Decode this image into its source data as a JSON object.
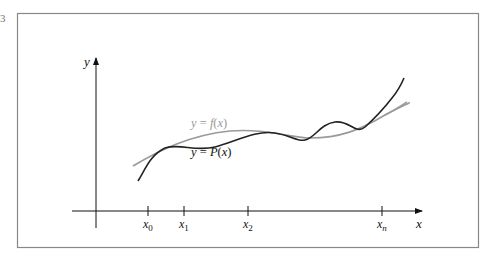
{
  "figure": {
    "edge_mark": "3",
    "y_axis_label": "y",
    "x_axis_label": "x",
    "ticks": [
      {
        "base": "x",
        "sub": "0",
        "x": 148
      },
      {
        "base": "x",
        "sub": "1",
        "x": 184
      },
      {
        "base": "x",
        "sub": "2",
        "x": 248
      },
      {
        "base": "x",
        "sub": "n",
        "x": 382
      }
    ],
    "curves": [
      {
        "name": "f",
        "label": "y = f(x)",
        "color": "#999999"
      },
      {
        "name": "P",
        "label": "y = P(x)",
        "color": "#222222"
      }
    ],
    "frame_color": "#888888"
  }
}
